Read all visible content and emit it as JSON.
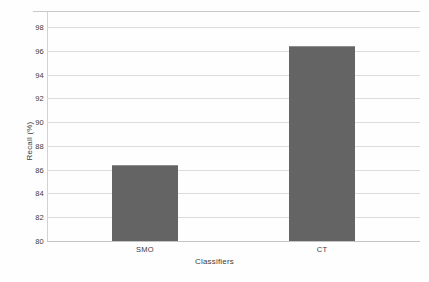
{
  "chart_data": {
    "type": "bar",
    "title": "",
    "xlabel": "Classifiers",
    "ylabel": "Recall (%)",
    "categories": [
      "SMO",
      "CT"
    ],
    "values": [
      86.4,
      96.4
    ],
    "ylim": [
      80,
      98
    ],
    "yticks": [
      80,
      82,
      84,
      86,
      88,
      90,
      92,
      94,
      96,
      98
    ],
    "ytick_labels": [
      "80",
      "82",
      "84",
      "86",
      "88",
      "90",
      "92",
      "94",
      "96",
      "98"
    ],
    "grid": true,
    "legend": "none",
    "bar_color": "#646464",
    "gridline_color": "#dcdcdc",
    "background_color": "#fefefe"
  }
}
